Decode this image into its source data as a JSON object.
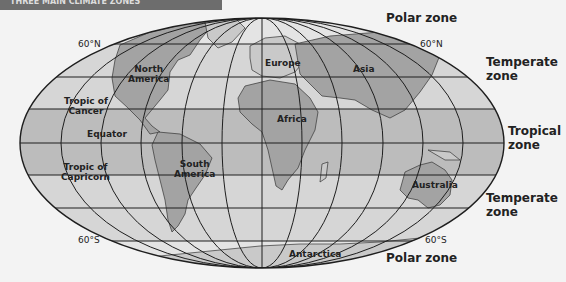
{
  "header": {
    "title": "THREE MAIN CLIMATE ZONES"
  },
  "zones": {
    "polar_north": "Polar zone",
    "temperate_north_1": "Temperate",
    "temperate_north_2": "zone",
    "tropical_1": "Tropical",
    "tropical_2": "zone",
    "temperate_south_1": "Temperate",
    "temperate_south_2": "zone",
    "polar_south": "Polar zone"
  },
  "latitudes": {
    "n60_left": "60°N",
    "n60_right": "60°N",
    "s60_left": "60°S",
    "s60_right": "60°S",
    "cancer_1": "Tropic of",
    "cancer_2": "Cancer",
    "equator": "Equator",
    "capricorn_1": "Tropic of",
    "capricorn_2": "Capricorn"
  },
  "continents": {
    "north_america_1": "North",
    "north_america_2": "America",
    "south_america_1": "South",
    "south_america_2": "America",
    "europe": "Europe",
    "asia": "Asia",
    "africa": "Africa",
    "australia": "Australia",
    "antarctica": "Antarctica"
  },
  "colors": {
    "background": "#f3f3f3",
    "temperate_band": "#d6d6d6",
    "tropical_band": "#bcbcbc",
    "polar_band": "#e4e4e4",
    "land": "#a3a3a3",
    "land_light": "#c9c9c9",
    "line": "#1e1e1e"
  }
}
